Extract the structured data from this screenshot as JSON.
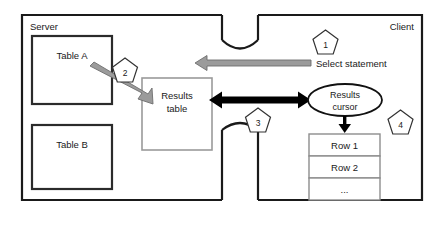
{
  "diagram": {
    "zones": [
      {
        "id": "server",
        "label": "Server"
      },
      {
        "id": "client",
        "label": "Client"
      }
    ],
    "server_tables": [
      {
        "id": "table-a",
        "label": "Table A"
      },
      {
        "id": "table-b",
        "label": "Table B"
      }
    ],
    "results_table": {
      "line1": "Results",
      "line2": "table"
    },
    "results_cursor": {
      "line1": "Results",
      "line2": "cursor"
    },
    "rows": [
      {
        "id": "row-1",
        "label": "Row 1"
      },
      {
        "id": "row-2",
        "label": "Row 2"
      },
      {
        "id": "row-ellipsis",
        "label": "..."
      }
    ],
    "connectors": [
      {
        "id": "select-statement-arrow",
        "label": "Select statement",
        "direction": "client-to-server",
        "color": "#9b9b9b"
      },
      {
        "id": "table-to-results-arrow",
        "label": "",
        "direction": "table-a-to-results-table",
        "color": "#9b9b9b"
      },
      {
        "id": "results-transfer-arrow",
        "label": "",
        "direction": "bidirectional",
        "color": "#000000"
      },
      {
        "id": "cursor-to-rows-arrow",
        "label": "",
        "direction": "down",
        "color": "#000000"
      }
    ],
    "callouts": [
      {
        "id": "callout-1",
        "number": "1"
      },
      {
        "id": "callout-2",
        "number": "2"
      },
      {
        "id": "callout-3",
        "number": "3"
      },
      {
        "id": "callout-4",
        "number": "4"
      }
    ],
    "colors": {
      "outline": "#1a1a1a",
      "gray_accent": "#9b9b9b",
      "box_border": "#9a9a9a",
      "background": "#ffffff"
    }
  }
}
